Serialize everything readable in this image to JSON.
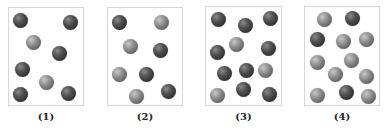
{
  "figure": {
    "ball_colors": {
      "dark": "#3a3a3a",
      "light": "#8d8d8d"
    },
    "panels": [
      {
        "label": "(1)",
        "box": {
          "x": 8,
          "y": 7,
          "w": 76,
          "h": 99
        },
        "balls": [
          {
            "x": 20,
            "y": 20,
            "type": "dark"
          },
          {
            "x": 70,
            "y": 22,
            "type": "dark"
          },
          {
            "x": 33,
            "y": 42,
            "type": "light"
          },
          {
            "x": 59,
            "y": 53,
            "type": "dark"
          },
          {
            "x": 22,
            "y": 69,
            "type": "dark"
          },
          {
            "x": 46,
            "y": 82,
            "type": "light"
          },
          {
            "x": 20,
            "y": 94,
            "type": "dark"
          },
          {
            "x": 68,
            "y": 93,
            "type": "dark"
          }
        ]
      },
      {
        "label": "(2)",
        "box": {
          "x": 107,
          "y": 7,
          "w": 76,
          "h": 99
        },
        "balls": [
          {
            "x": 119,
            "y": 22,
            "type": "dark"
          },
          {
            "x": 161,
            "y": 22,
            "type": "light"
          },
          {
            "x": 130,
            "y": 46,
            "type": "light"
          },
          {
            "x": 160,
            "y": 50,
            "type": "dark"
          },
          {
            "x": 119,
            "y": 74,
            "type": "light"
          },
          {
            "x": 146,
            "y": 74,
            "type": "dark"
          },
          {
            "x": 136,
            "y": 96,
            "type": "light"
          },
          {
            "x": 168,
            "y": 91,
            "type": "dark"
          }
        ]
      },
      {
        "label": "(3)",
        "box": {
          "x": 205,
          "y": 6,
          "w": 77,
          "h": 100
        },
        "balls": [
          {
            "x": 218,
            "y": 19,
            "type": "dark"
          },
          {
            "x": 245,
            "y": 25,
            "type": "dark"
          },
          {
            "x": 270,
            "y": 18,
            "type": "dark"
          },
          {
            "x": 236,
            "y": 44,
            "type": "light"
          },
          {
            "x": 217,
            "y": 52,
            "type": "dark"
          },
          {
            "x": 268,
            "y": 48,
            "type": "dark"
          },
          {
            "x": 224,
            "y": 73,
            "type": "dark"
          },
          {
            "x": 246,
            "y": 70,
            "type": "dark"
          },
          {
            "x": 265,
            "y": 70,
            "type": "light"
          },
          {
            "x": 217,
            "y": 95,
            "type": "light"
          },
          {
            "x": 243,
            "y": 89,
            "type": "dark"
          },
          {
            "x": 269,
            "y": 94,
            "type": "dark"
          }
        ]
      },
      {
        "label": "(4)",
        "box": {
          "x": 304,
          "y": 6,
          "w": 76,
          "h": 100
        },
        "balls": [
          {
            "x": 324,
            "y": 19,
            "type": "light"
          },
          {
            "x": 352,
            "y": 18,
            "type": "dark"
          },
          {
            "x": 317,
            "y": 39,
            "type": "dark"
          },
          {
            "x": 343,
            "y": 41,
            "type": "light"
          },
          {
            "x": 366,
            "y": 39,
            "type": "light"
          },
          {
            "x": 317,
            "y": 62,
            "type": "light"
          },
          {
            "x": 351,
            "y": 60,
            "type": "light"
          },
          {
            "x": 335,
            "y": 74,
            "type": "light"
          },
          {
            "x": 366,
            "y": 76,
            "type": "light"
          },
          {
            "x": 317,
            "y": 95,
            "type": "light"
          },
          {
            "x": 346,
            "y": 92,
            "type": "dark"
          },
          {
            "x": 368,
            "y": 96,
            "type": "light"
          }
        ]
      }
    ]
  }
}
